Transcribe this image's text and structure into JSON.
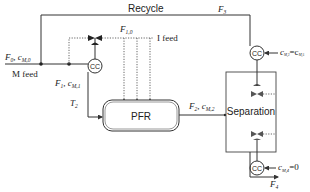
{
  "diagram": {
    "type": "process-flow",
    "units": {
      "reactor": {
        "label": "PFR"
      },
      "separator": {
        "label": "Separation"
      },
      "controllers": [
        {
          "id": "cc-feed",
          "label": "CC"
        },
        {
          "id": "cc-recycle",
          "label": "CC"
        },
        {
          "id": "cc-bottom",
          "label": "CC"
        }
      ]
    },
    "streams": {
      "recycle_label": "Recycle",
      "f3": "F",
      "f3_sub": "3",
      "f0": "F",
      "f0_sub": "0",
      "c_m0": "c",
      "c_m0_sub": "M,0",
      "m_feed": "M feed",
      "f1": "F",
      "f1_sub": "1",
      "c_m1": "c",
      "c_m1_sub": "M,1",
      "f10": "F",
      "f10_sub": "1,0",
      "i_feed": "I feed",
      "t2": "T",
      "t2_sub": "2",
      "f2": "F",
      "f2_sub": "2",
      "c_m2": "c",
      "c_m2_sub": "M,2",
      "c_m3_eq": "c",
      "c_m3_sub": "M,3",
      "eq_sign": "=c",
      "c_m5_sub": "M,5",
      "c_m4": "c",
      "c_m4_sub": "M,4",
      "c_m4_val": "=0",
      "f4": "F",
      "f4_sub": "4",
      "sep_comma": ", "
    }
  }
}
